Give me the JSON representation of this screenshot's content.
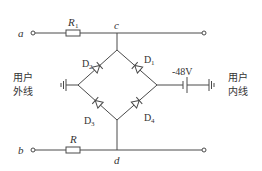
{
  "diagram": {
    "type": "circuit",
    "colors": {
      "line": "#4a4a4a",
      "text": "#333333",
      "background": "#ffffff"
    },
    "terminals": {
      "a": {
        "label": "a"
      },
      "b": {
        "label": "b"
      }
    },
    "nodes": {
      "c": {
        "label": "c"
      },
      "d": {
        "label": "d"
      }
    },
    "resistors": [
      {
        "id": "R1",
        "label_main": "R",
        "label_sub": "1"
      },
      {
        "id": "R",
        "label_main": "R",
        "label_sub": ""
      }
    ],
    "diodes": [
      {
        "id": "D1",
        "label_main": "D",
        "label_sub": "1",
        "position": "upper-right"
      },
      {
        "id": "D2",
        "label_main": "D",
        "label_sub": "2",
        "position": "upper-left"
      },
      {
        "id": "D3",
        "label_main": "D",
        "label_sub": "3",
        "position": "lower-left"
      },
      {
        "id": "D4",
        "label_main": "D",
        "label_sub": "4",
        "position": "lower-right"
      }
    ],
    "battery": {
      "label": "-48V"
    },
    "side_labels": {
      "left": {
        "line1": "用户",
        "line2": "外线"
      },
      "right": {
        "line1": "用户",
        "line2": "内线"
      }
    }
  }
}
